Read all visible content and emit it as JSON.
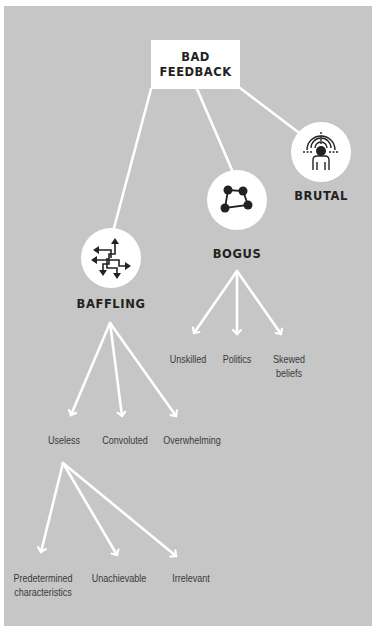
{
  "diagram": {
    "root": {
      "line1": "BAD",
      "line2": "FEEDBACK"
    },
    "categories": [
      {
        "id": "baffling",
        "label": "BAFFLING",
        "icon": "crossing-arrows-icon"
      },
      {
        "id": "bogus",
        "label": "BOGUS",
        "icon": "connected-nodes-icon"
      },
      {
        "id": "brutal",
        "label": "BRUTAL",
        "icon": "target-person-icon"
      }
    ],
    "bogus_children": [
      {
        "line1": "Unskilled",
        "line2": ""
      },
      {
        "line1": "Politics",
        "line2": ""
      },
      {
        "line1": "Skewed",
        "line2": "beliefs"
      }
    ],
    "baffling_children": [
      {
        "line1": "Useless"
      },
      {
        "line1": "Convoluted"
      },
      {
        "line1": "Overwhelming"
      }
    ],
    "useless_children": [
      {
        "line1": "Predetermined",
        "line2": "characteristics"
      },
      {
        "line1": "Unachievable",
        "line2": ""
      },
      {
        "line1": "Irrelevant",
        "line2": ""
      }
    ]
  },
  "colors": {
    "panel": "#c6c6c6",
    "connector": "#ffffff",
    "text": "#222222"
  }
}
